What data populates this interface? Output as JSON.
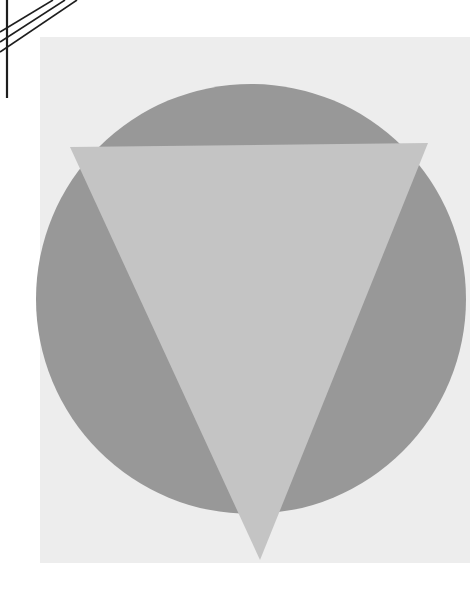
{
  "artwork": {
    "title": "Inverted triangle over circle",
    "canvas": {
      "width": 475,
      "height": 598,
      "background": "#ffffff"
    },
    "corner_lines": {
      "color": "#1e1e1e",
      "vertical": {
        "x": 7,
        "y1": 0,
        "y2": 98,
        "stroke_width": 2.2
      },
      "diagonals": [
        {
          "x1": 53,
          "y1": 0,
          "x2": 0,
          "y2": 32,
          "stroke_width": 1.6
        },
        {
          "x1": 65,
          "y1": 0,
          "x2": 0,
          "y2": 42,
          "stroke_width": 1.6
        },
        {
          "x1": 77,
          "y1": 0,
          "x2": 0,
          "y2": 52,
          "stroke_width": 1.6
        }
      ]
    },
    "panel": {
      "x": 40,
      "y": 37,
      "width": 430,
      "height": 526,
      "fill": "#ededed"
    },
    "circle": {
      "cx": 251,
      "cy": 299,
      "r": 215,
      "fill": "#989898"
    },
    "triangle": {
      "points": [
        [
          70,
          147
        ],
        [
          428,
          143
        ],
        [
          260,
          560
        ]
      ],
      "fill": "#c4c4c4"
    }
  }
}
